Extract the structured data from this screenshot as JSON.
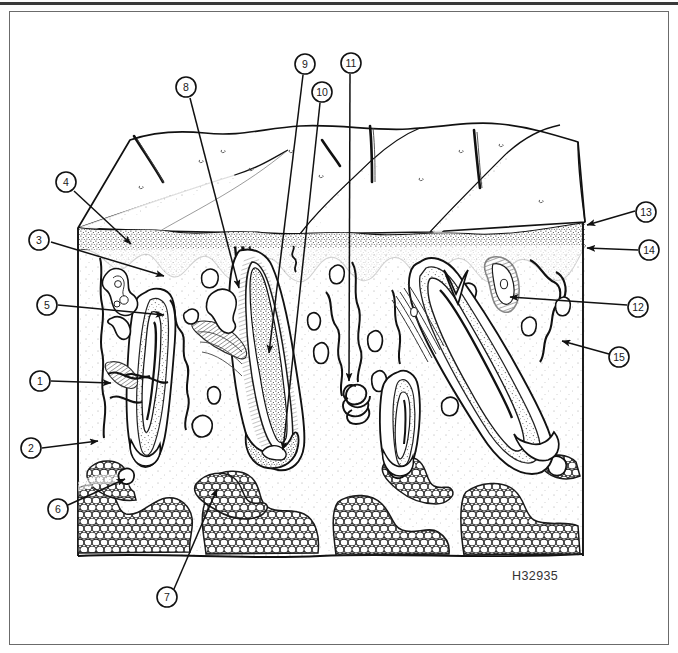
{
  "figure": {
    "code": "H32935",
    "accent_color": "#1a1a1a",
    "background_color": "#ffffff"
  },
  "callouts": [
    {
      "id": 1,
      "label": "1",
      "cx": 40,
      "cy": 381,
      "tip_x": 113,
      "tip_y": 383
    },
    {
      "id": 2,
      "label": "2",
      "cx": 31,
      "cy": 448,
      "tip_x": 100,
      "tip_y": 441
    },
    {
      "id": 3,
      "label": "3",
      "cx": 39,
      "cy": 240,
      "tip_x": 166,
      "tip_y": 276
    },
    {
      "id": 4,
      "label": "4",
      "cx": 66,
      "cy": 182,
      "tip_x": 133,
      "tip_y": 245
    },
    {
      "id": 5,
      "label": "5",
      "cx": 47,
      "cy": 305,
      "tip_x": 166,
      "tip_y": 315
    },
    {
      "id": 6,
      "label": "6",
      "cx": 58,
      "cy": 509,
      "tip_x": 123,
      "tip_y": 478
    },
    {
      "id": 7,
      "label": "7",
      "cx": 167,
      "cy": 597,
      "tip_x": 215,
      "tip_y": 487
    },
    {
      "id": 8,
      "label": "8",
      "cx": 186,
      "cy": 87,
      "tip_x": 240,
      "tip_y": 290
    },
    {
      "id": 9,
      "label": "9",
      "cx": 305,
      "cy": 64,
      "tip_x": 268,
      "tip_y": 355
    },
    {
      "id": 10,
      "label": "10",
      "cx": 322,
      "cy": 92,
      "tip_x": 282,
      "tip_y": 452
    },
    {
      "id": 11,
      "label": "11",
      "cx": 351,
      "cy": 63,
      "tip_x": 349,
      "tip_y": 383
    },
    {
      "id": 12,
      "label": "12",
      "cx": 638,
      "cy": 307,
      "tip_x": 508,
      "tip_y": 296
    },
    {
      "id": 13,
      "label": "13",
      "cx": 646,
      "cy": 212,
      "tip_x": 585,
      "tip_y": 225
    },
    {
      "id": 14,
      "label": "14",
      "cx": 649,
      "cy": 250,
      "tip_x": 585,
      "tip_y": 248
    },
    {
      "id": 15,
      "label": "15",
      "cx": 619,
      "cy": 357,
      "tip_x": 560,
      "tip_y": 340
    }
  ],
  "structures": {
    "skin_block": {
      "left": 78,
      "right": 583,
      "epidermis_top": 228,
      "epidermis_bottom": 248,
      "bottom": 556
    },
    "layers": [
      "epidermis",
      "dermis",
      "subcutaneous-fat"
    ],
    "features": [
      "hair-shaft",
      "hair-follicle",
      "sebaceous-gland",
      "sweat-gland",
      "arrector-pili-muscle",
      "blood-vessel",
      "nerve",
      "fat-lobule"
    ]
  }
}
